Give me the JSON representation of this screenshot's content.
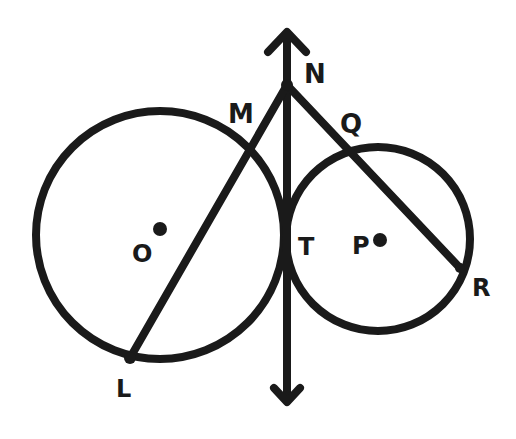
{
  "diagram": {
    "type": "geometry-tangent-circles",
    "stroke_color": "#1a1a1a",
    "background": "#ffffff",
    "circles": [
      {
        "name": "O",
        "label": "O",
        "center": [
          160,
          235
        ],
        "radius": 124
      },
      {
        "name": "P",
        "label": "P",
        "center": [
          378,
          239
        ],
        "radius": 92
      }
    ],
    "common_tangent_line": {
      "x": 286,
      "y_top": 30,
      "y_bottom": 405,
      "arrows": "both"
    },
    "points": {
      "N": {
        "label": "N",
        "pos": [
          286,
          85
        ]
      },
      "M": {
        "label": "M",
        "pos": [
          240,
          170
        ]
      },
      "L": {
        "label": "L",
        "pos": [
          130,
          358
        ]
      },
      "Q": {
        "label": "Q",
        "pos": [
          350,
          152
        ]
      },
      "R": {
        "label": "R",
        "pos": [
          460,
          268
        ]
      },
      "T": {
        "label": "T",
        "pos": [
          286,
          237
        ]
      },
      "O": {
        "label": "O",
        "pos": [
          160,
          230
        ]
      },
      "P": {
        "label": "P",
        "pos": [
          380,
          240
        ]
      }
    },
    "segments": [
      {
        "from": "N",
        "to": "L"
      },
      {
        "from": "N",
        "to": "R"
      }
    ],
    "labels": {
      "N": "N",
      "M": "M",
      "Q": "Q",
      "T": "T",
      "O": "O",
      "P": "P",
      "R": "R",
      "L": "L"
    }
  }
}
